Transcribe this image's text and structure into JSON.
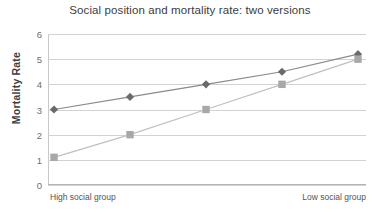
{
  "chart_data": {
    "type": "line",
    "title": "Social position and mortality rate: two versions",
    "xlabel": "",
    "ylabel": "Mortality Rate",
    "ylim": [
      0,
      6
    ],
    "yticks": [
      0,
      1,
      2,
      3,
      4,
      5,
      6
    ],
    "grid": true,
    "legend": "none",
    "x": [
      1,
      2,
      3,
      4,
      5
    ],
    "xtick_labels": [
      "High social group",
      "Low social group"
    ],
    "xtick_left_label": "High social group",
    "xtick_right_label": "Low social group",
    "series": [
      {
        "name": "version-1-diamonds",
        "marker": "diamond",
        "color": "#6a6a6a",
        "line_color": "#8a8a8a",
        "values": [
          3.0,
          3.5,
          4.0,
          4.5,
          5.2
        ]
      },
      {
        "name": "version-2-squares",
        "marker": "square",
        "color": "#a8a8a8",
        "line_color": "#c0c0c0",
        "values": [
          1.1,
          2.0,
          3.0,
          4.0,
          5.0
        ]
      }
    ]
  },
  "colors": {
    "grid": "#d2d2d2",
    "axis": "#b4b4b4",
    "title_text": "#3c3c3c",
    "tick_text": "#6e6e6e",
    "background": "#ffffff"
  }
}
